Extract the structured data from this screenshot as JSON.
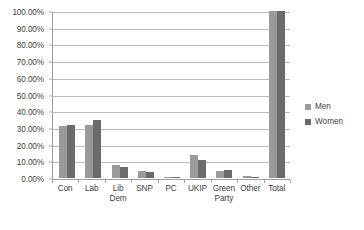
{
  "chart_data": {
    "type": "bar",
    "title": "",
    "subtitle": "",
    "xlabel": "",
    "ylabel": "",
    "ylim": [
      0,
      100
    ],
    "grid": true,
    "legend_position": "right",
    "categories": [
      "Con",
      "Lib\nDem",
      "Lab",
      "SNP",
      "PC",
      "UKIP",
      "Green\nParty",
      "Other",
      "Total"
    ],
    "category_order": [
      "Con",
      "Lab",
      "Lib\nDem",
      "SNP",
      "PC",
      "UKIP",
      "Green\nParty",
      "Other",
      "Total"
    ],
    "y_ticks": [
      "0.00%",
      "10.00%",
      "20.00%",
      "30.00%",
      "40.00%",
      "50.00%",
      "60.00%",
      "70.00%",
      "80.00%",
      "90.00%",
      "100.00%"
    ],
    "y_tick_values": [
      0,
      10,
      20,
      30,
      40,
      50,
      60,
      70,
      80,
      90,
      100
    ],
    "series": [
      {
        "name": "Men",
        "color": "#9a9a9a",
        "values": [
          31.0,
          32.0,
          8.0,
          4.0,
          0.5,
          14.0,
          4.5,
          1.0,
          100.0
        ]
      },
      {
        "name": "Women",
        "color": "#6b6b6b",
        "values": [
          31.5,
          34.8,
          6.5,
          3.8,
          0.4,
          11.0,
          5.0,
          0.8,
          100.0
        ]
      }
    ],
    "legend": [
      "Men",
      "Women"
    ],
    "colors": {
      "men": "#9a9a9a",
      "women": "#6b6b6b",
      "gridline": "#b9b9b9",
      "axis": "#a0a0a0",
      "text": "#3f3f3f",
      "background": "#ffffff"
    }
  }
}
